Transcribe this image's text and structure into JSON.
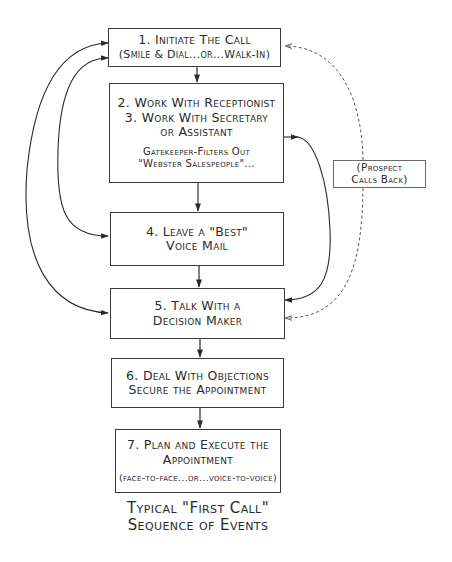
{
  "diagram": {
    "title_line1": "Typical \"First Call\"",
    "title_line2": "Sequence of Events",
    "boxes": [
      {
        "id": "1",
        "lines": [
          "1. Initiate The Call"
        ],
        "sub": "(Smile & Dial...or...Walk-In)"
      },
      {
        "id": "2-3",
        "lines": [
          "2. Work With Receptionist",
          "3. Work With Secretary",
          "or Assistant"
        ],
        "note_lines": [
          "Gatekeeper-Filters Out",
          "\"Webster Salespeople\"..."
        ]
      },
      {
        "id": "4",
        "lines": [
          "4. Leave a \"Best\"",
          "Voice Mail"
        ]
      },
      {
        "id": "5",
        "lines": [
          "5. Talk With a",
          "Decision Maker"
        ]
      },
      {
        "id": "6",
        "lines": [
          "6. Deal With Objections",
          "Secure the Appointment"
        ]
      },
      {
        "id": "7",
        "lines": [
          "7. Plan and Execute the",
          "Appointment"
        ],
        "sub": "(face-to-face...or...voice-to-voice)"
      }
    ],
    "side_note": {
      "lines": [
        "(Prospect",
        "Calls Back)"
      ]
    },
    "connectors": [
      {
        "from": "1",
        "to": "2-3",
        "style": "solid"
      },
      {
        "from": "2-3",
        "to": "4",
        "style": "solid"
      },
      {
        "from": "4",
        "to": "5",
        "style": "solid"
      },
      {
        "from": "5",
        "to": "6",
        "style": "solid"
      },
      {
        "from": "6",
        "to": "7",
        "style": "solid"
      },
      {
        "from": "4",
        "to": "1",
        "style": "solid-curve-left",
        "bidirectional": true
      },
      {
        "from": "5",
        "to": "1",
        "style": "solid-curve-left",
        "bidirectional": true
      },
      {
        "from": "2-3",
        "to": "5",
        "style": "solid-curve-right"
      },
      {
        "from": "side_note",
        "to": "1",
        "style": "dashed-curve-right"
      },
      {
        "from": "side_note",
        "to": "5",
        "style": "dashed-curve-right"
      }
    ],
    "colors": {
      "ink": "#2a2a2a",
      "box_border": "#3a3a3a",
      "dashed_line": "#555555",
      "background": "#ffffff"
    }
  }
}
